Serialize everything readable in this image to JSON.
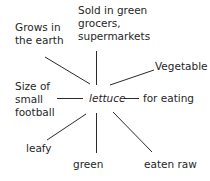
{
  "diagram": {
    "type": "spider-diagram",
    "center": "lettuce",
    "nodes": [
      {
        "id": "grows",
        "text": "Grows in\nthe earth"
      },
      {
        "id": "sold",
        "text": "Sold in green\ngrocers,\nsupermarkets"
      },
      {
        "id": "vegetable",
        "text": "Vegetable"
      },
      {
        "id": "size",
        "text": "Size of\nsmall\nfootball"
      },
      {
        "id": "eating",
        "text": "for eating"
      },
      {
        "id": "leafy",
        "text": "leafy"
      },
      {
        "id": "green",
        "text": "green"
      },
      {
        "id": "raw",
        "text": "eaten raw"
      }
    ],
    "colors": {
      "line": "#2a2a2a",
      "text": "#1f1f1f",
      "background": "#ffffff"
    }
  }
}
